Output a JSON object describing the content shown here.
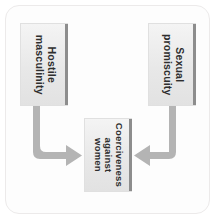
{
  "figure": {
    "type": "flow-diagram",
    "frame_color": "#eceaea",
    "box_fill": "#e8e8e8",
    "box_edge_shadow": "#8d8d8d",
    "arrow_color": "#b0b0b0",
    "text_color": "#2e2e2e",
    "text_orientation": "rotated-90-clockwise"
  },
  "nodes": [
    {
      "id": "hostile-masculinity",
      "lines": [
        "Hostile",
        "masculinity"
      ],
      "text": "Hostile masculinity",
      "position": "top-left"
    },
    {
      "id": "sexual-promiscuity",
      "lines": [
        "Sexual",
        "promiscuity"
      ],
      "text": "Sexual promiscuity",
      "position": "top-right"
    },
    {
      "id": "coerciveness-against-women",
      "lines": [
        "Coerciveness",
        "against",
        "women"
      ],
      "text": "Coerciveness against women",
      "position": "bottom-center"
    }
  ],
  "arrows": [
    {
      "id": "hostile-to-coerciveness",
      "from": "hostile-masculinity",
      "to": "coerciveness-against-women",
      "shape": "elbow-down-right",
      "head": "right"
    },
    {
      "id": "sexual-to-coerciveness",
      "from": "sexual-promiscuity",
      "to": "coerciveness-against-women",
      "shape": "elbow-down-left",
      "head": "left"
    }
  ]
}
